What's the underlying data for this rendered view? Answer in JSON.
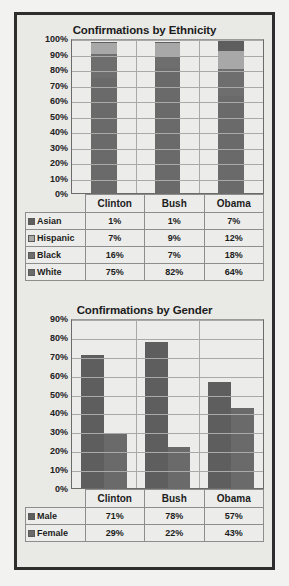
{
  "page": {
    "background": "#f2f2f0",
    "frame_color": "#2e2e2e",
    "panel_color": "#e9e9e6"
  },
  "chart_data": [
    {
      "id": "ethnicity",
      "type": "bar",
      "subtype": "stacked-100",
      "title": "Confirmations by Ethnicity",
      "xlabel": "",
      "ylabel": "",
      "ylim": [
        0,
        100
      ],
      "grid": true,
      "legend_position": "data-table",
      "categories": [
        "Clinton",
        "Bush",
        "Obama"
      ],
      "tick_labels": [
        "0%",
        "10%",
        "20%",
        "30%",
        "40%",
        "50%",
        "60%",
        "70%",
        "80%",
        "90%",
        "100%"
      ],
      "tick_values": [
        0,
        10,
        20,
        30,
        40,
        50,
        60,
        70,
        80,
        90,
        100
      ],
      "series": [
        {
          "name": "Asian",
          "color": "#5e5e5e",
          "values": [
            1,
            1,
            7
          ],
          "labels": [
            "1%",
            "1%",
            "7%"
          ]
        },
        {
          "name": "Hispanic",
          "color": "#a8a8a8",
          "values": [
            7,
            9,
            12
          ],
          "labels": [
            "7%",
            "9%",
            "12%"
          ]
        },
        {
          "name": "Black",
          "color": "#6e6e6e",
          "values": [
            16,
            7,
            18
          ],
          "labels": [
            "16%",
            "7%",
            "18%"
          ]
        },
        {
          "name": "White",
          "color": "#6a6a6a",
          "values": [
            75,
            82,
            64
          ],
          "labels": [
            "75%",
            "82%",
            "64%"
          ]
        }
      ],
      "stack_order_bottom_to_top": [
        "White",
        "Black",
        "Hispanic",
        "Asian"
      ]
    },
    {
      "id": "gender",
      "type": "bar",
      "subtype": "grouped",
      "title": "Confirmations by Gender",
      "xlabel": "",
      "ylabel": "",
      "ylim": [
        0,
        90
      ],
      "grid": true,
      "legend_position": "data-table",
      "categories": [
        "Clinton",
        "Bush",
        "Obama"
      ],
      "tick_labels": [
        "0%",
        "10%",
        "20%",
        "30%",
        "40%",
        "50%",
        "60%",
        "70%",
        "80%",
        "90%"
      ],
      "tick_values": [
        0,
        10,
        20,
        30,
        40,
        50,
        60,
        70,
        80,
        90
      ],
      "series": [
        {
          "name": "Male",
          "color": "#5e5e5e",
          "values": [
            71,
            78,
            57
          ],
          "labels": [
            "71%",
            "78%",
            "57%"
          ]
        },
        {
          "name": "Female",
          "color": "#6a6a6a",
          "values": [
            29,
            22,
            43
          ],
          "labels": [
            "29%",
            "22%",
            "43%"
          ]
        }
      ]
    }
  ]
}
